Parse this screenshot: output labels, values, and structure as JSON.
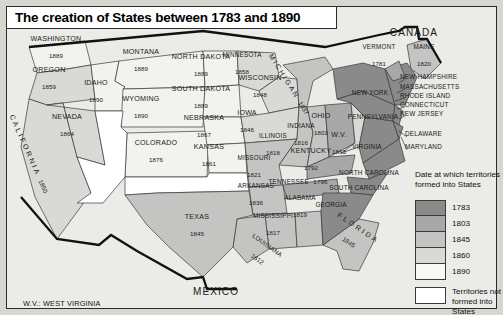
{
  "map": {
    "title": "The creation of States between 1783 and 1890",
    "footnote": "W.V.: WEST VIRGINIA",
    "neighbors": [
      {
        "name": "CANADA",
        "x": 413,
        "y": 32
      },
      {
        "name": "MEXICO",
        "x": 215,
        "y": 291
      }
    ],
    "legend": {
      "heading": "Date at which territories formed into States",
      "entries": [
        {
          "label": "1783",
          "color": "#8a8a8a"
        },
        {
          "label": "1803",
          "color": "#a8a8a8"
        },
        {
          "label": "1845",
          "color": "#c4c4c2"
        },
        {
          "label": "1860",
          "color": "#d9d9d6"
        },
        {
          "label": "1890",
          "color": "#f2f2ef"
        }
      ],
      "territories": {
        "label": "Territories not formed into States",
        "color": "#ffffff"
      }
    },
    "states": [
      {
        "name": "WASHINGTON",
        "date": "1889",
        "x": 55,
        "y": 44,
        "era": "1890"
      },
      {
        "name": "OREGON",
        "date": "1859",
        "x": 48,
        "y": 75,
        "era": "1860"
      },
      {
        "name": "IDAHO",
        "date": "1890",
        "x": 95,
        "y": 88,
        "era": "1890"
      },
      {
        "name": "NEVADA",
        "date": "1864",
        "x": 66,
        "y": 122,
        "era": "1860"
      },
      {
        "name": "CALIFORNIA",
        "date": "1850",
        "x": 30,
        "y": 150,
        "era": "1860"
      },
      {
        "name": "MONTANA",
        "date": "1889",
        "x": 140,
        "y": 57,
        "era": "1890"
      },
      {
        "name": "WYOMING",
        "date": "1890",
        "x": 140,
        "y": 104,
        "era": "1890"
      },
      {
        "name": "COLORADO",
        "date": "1876",
        "x": 155,
        "y": 148,
        "era": "1890"
      },
      {
        "name": "NORTH DAKOTA",
        "date": "1889",
        "x": 200,
        "y": 62,
        "era": "1890"
      },
      {
        "name": "SOUTH DAKOTA",
        "date": "1889",
        "x": 200,
        "y": 94,
        "era": "1890"
      },
      {
        "name": "NEBRASKA",
        "date": "1867",
        "x": 203,
        "y": 123,
        "era": "1890"
      },
      {
        "name": "KANSAS",
        "date": "1861",
        "x": 208,
        "y": 152,
        "era": "1890"
      },
      {
        "name": "MINNESOTA",
        "date": "1858",
        "x": 241,
        "y": 60,
        "era": "1860"
      },
      {
        "name": "WISCONSIN",
        "date": "1848",
        "x": 259,
        "y": 83,
        "era": "1860"
      },
      {
        "name": "MICHIGAN",
        "date": "1837",
        "x": 290,
        "y": 82,
        "era": "1845"
      },
      {
        "name": "IOWA",
        "date": "1846",
        "x": 246,
        "y": 118,
        "era": "1860"
      },
      {
        "name": "ILLINOIS",
        "date": "1818",
        "x": 272,
        "y": 141,
        "era": "1845"
      },
      {
        "name": "INDIANA",
        "date": "1816",
        "x": 300,
        "y": 131,
        "era": "1845"
      },
      {
        "name": "OHIO",
        "date": "1803",
        "x": 320,
        "y": 121,
        "era": "1803"
      },
      {
        "name": "MISSOURI",
        "date": "1821",
        "x": 253,
        "y": 163,
        "era": "1845"
      },
      {
        "name": "ARKANSAS",
        "date": "1836",
        "x": 255,
        "y": 191,
        "era": "1845"
      },
      {
        "name": "MISSISSIPPI",
        "date": "1817",
        "x": 272,
        "y": 221,
        "era": "1845"
      },
      {
        "name": "LOUISIANA",
        "date": "1812",
        "x": 263,
        "y": 249,
        "era": "1845"
      },
      {
        "name": "ALABAMA",
        "date": "1819",
        "x": 299,
        "y": 203,
        "era": "1845"
      },
      {
        "name": "TENNESSEE",
        "date": "1796",
        "x": 297,
        "y": 178,
        "era": "1803"
      },
      {
        "name": "KENTUCKY",
        "date": "1792",
        "x": 310,
        "y": 156,
        "era": "1803"
      },
      {
        "name": "TEXAS",
        "date": "1845",
        "x": 196,
        "y": 222,
        "era": "1845"
      },
      {
        "name": "FLORIDA",
        "date": "1845",
        "x": 352,
        "y": 232,
        "era": "1845"
      },
      {
        "name": "W.V.",
        "date": "1863",
        "x": 338,
        "y": 140,
        "era": "1860"
      },
      {
        "name": "VERMONT",
        "date": "1781",
        "x": 378,
        "y": 52,
        "era": "1803"
      },
      {
        "name": "MAINE",
        "date": "1820",
        "x": 423,
        "y": 52,
        "era": "1845"
      }
    ],
    "plain_states": [
      {
        "name": "NEW YORK",
        "x": 369,
        "y": 92
      },
      {
        "name": "PENNSYLVANIA",
        "x": 372,
        "y": 116
      },
      {
        "name": "VIRGINIA",
        "x": 366,
        "y": 146
      },
      {
        "name": "NORTH CAROLINA",
        "x": 368,
        "y": 172
      },
      {
        "name": "SOUTH CAROLINA",
        "x": 358,
        "y": 187
      },
      {
        "name": "GEORGIA",
        "x": 330,
        "y": 204
      }
    ],
    "callout_states": [
      {
        "name": "NEW HAMPSHIRE",
        "x": 399,
        "y": 76
      },
      {
        "name": "MASSACHUSETTS",
        "x": 399,
        "y": 86
      },
      {
        "name": "RHODE ISLAND",
        "x": 399,
        "y": 95
      },
      {
        "name": "CONNECTICUT",
        "x": 399,
        "y": 104
      },
      {
        "name": "NEW JERSEY",
        "x": 399,
        "y": 113
      },
      {
        "name": "DELAWARE",
        "x": 404,
        "y": 133
      },
      {
        "name": "MARYLAND",
        "x": 404,
        "y": 146
      }
    ]
  }
}
